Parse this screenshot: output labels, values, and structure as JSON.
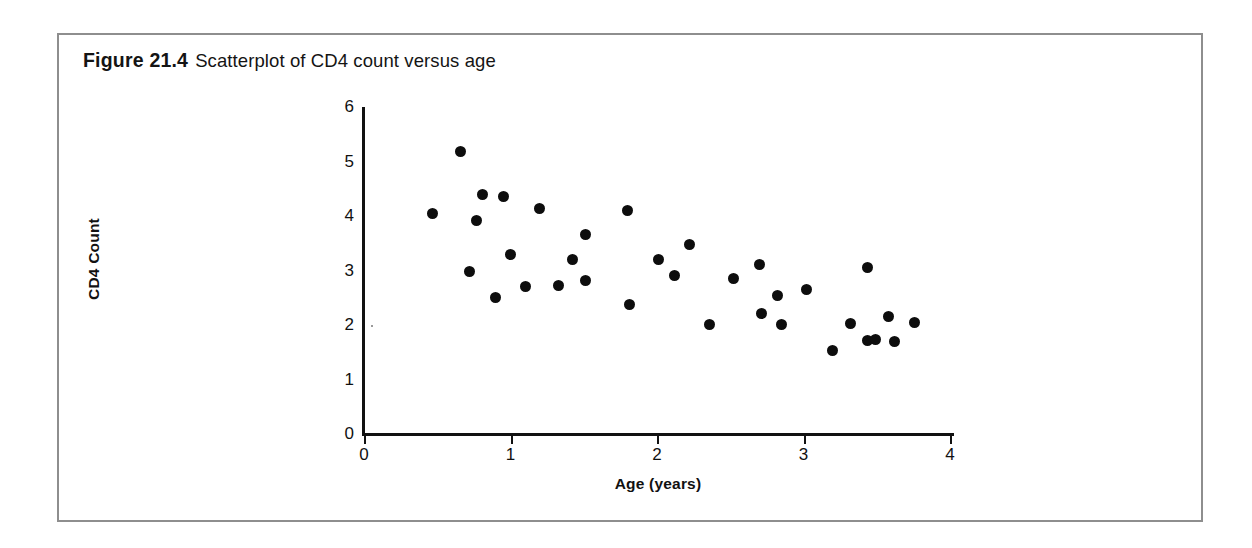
{
  "caption": {
    "figure_label": "Figure 21.4",
    "figure_text": "Scatterplot of CD4 count versus age"
  },
  "chart_data": {
    "type": "scatter",
    "title": "Scatterplot of CD4 count versus age",
    "xlabel": "Age (years)",
    "ylabel": "CD4 Count",
    "xlim": [
      0,
      4
    ],
    "ylim": [
      0,
      6
    ],
    "xticks": [
      0,
      1,
      2,
      3,
      4
    ],
    "yticks": [
      0,
      1,
      2,
      3,
      4,
      5,
      6
    ],
    "xtick_labels": [
      "0",
      "1",
      "2",
      "3",
      "4"
    ],
    "ytick_labels": [
      "0",
      "1",
      "2",
      "3",
      "4",
      "5",
      "6"
    ],
    "grid": false,
    "legend": false,
    "marker": "filled-circle",
    "marker_color": "#0d0d0d",
    "points": [
      {
        "x": 0.47,
        "y": 4.04
      },
      {
        "x": 0.66,
        "y": 5.19
      },
      {
        "x": 0.72,
        "y": 2.98
      },
      {
        "x": 0.81,
        "y": 4.39
      },
      {
        "x": 0.77,
        "y": 3.92
      },
      {
        "x": 0.95,
        "y": 4.35
      },
      {
        "x": 0.9,
        "y": 2.51
      },
      {
        "x": 1.0,
        "y": 3.3
      },
      {
        "x": 1.1,
        "y": 2.7
      },
      {
        "x": 1.2,
        "y": 4.13
      },
      {
        "x": 1.33,
        "y": 2.73
      },
      {
        "x": 1.42,
        "y": 3.21
      },
      {
        "x": 1.51,
        "y": 3.66
      },
      {
        "x": 1.51,
        "y": 2.81
      },
      {
        "x": 1.8,
        "y": 4.1
      },
      {
        "x": 1.81,
        "y": 2.37
      },
      {
        "x": 2.01,
        "y": 3.21
      },
      {
        "x": 2.12,
        "y": 2.91
      },
      {
        "x": 2.22,
        "y": 3.48
      },
      {
        "x": 2.36,
        "y": 2.01
      },
      {
        "x": 2.52,
        "y": 2.85
      },
      {
        "x": 2.7,
        "y": 3.11
      },
      {
        "x": 2.71,
        "y": 2.22
      },
      {
        "x": 2.82,
        "y": 2.54
      },
      {
        "x": 2.85,
        "y": 2.01
      },
      {
        "x": 3.02,
        "y": 2.65
      },
      {
        "x": 3.2,
        "y": 1.53
      },
      {
        "x": 3.32,
        "y": 2.02
      },
      {
        "x": 3.44,
        "y": 3.06
      },
      {
        "x": 3.44,
        "y": 1.72
      },
      {
        "x": 3.49,
        "y": 1.73
      },
      {
        "x": 3.58,
        "y": 2.15
      },
      {
        "x": 3.62,
        "y": 1.69
      },
      {
        "x": 3.76,
        "y": 2.05
      }
    ]
  }
}
